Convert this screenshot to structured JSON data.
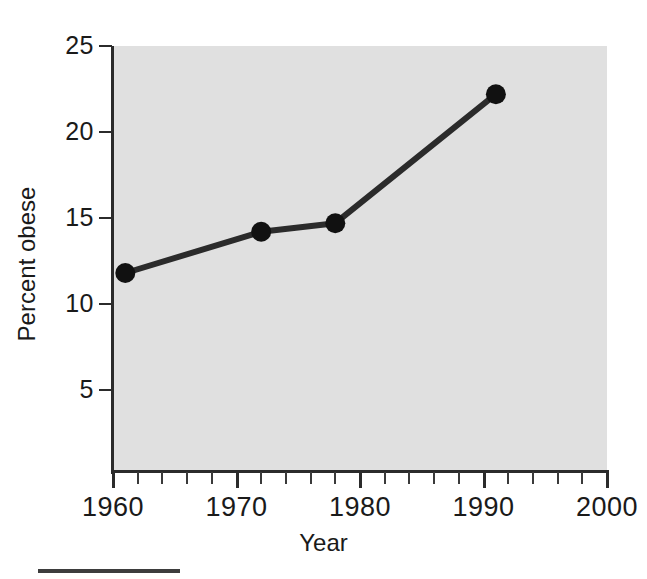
{
  "chart_data": {
    "type": "line",
    "title": "",
    "subtitle": "",
    "xlabel": "Year",
    "ylabel": "Percent obese",
    "xlim": [
      1960,
      2000
    ],
    "ylim": [
      0,
      25
    ],
    "xticks": [
      1960,
      1970,
      1980,
      1990,
      2000
    ],
    "xtick_labels": [
      "1960",
      "1970",
      "1980",
      "1990",
      "2000"
    ],
    "xminor_tick_step": 2,
    "yticks": [
      5,
      10,
      15,
      20,
      25
    ],
    "ytick_labels": [
      "5",
      "10",
      "15",
      "20",
      "25"
    ],
    "grid": false,
    "legend": null,
    "plot_background": "#e0e0e0",
    "line_color": "#2b2b2b",
    "marker_color": "#111111",
    "marker_style": "circle",
    "x": [
      1961,
      1972,
      1978,
      1991
    ],
    "y": [
      11.8,
      14.2,
      14.7,
      22.2
    ],
    "series": [
      {
        "name": "Percent obese",
        "points": [
          {
            "x": 1961,
            "y": 11.8
          },
          {
            "x": 1972,
            "y": 14.2
          },
          {
            "x": 1978,
            "y": 14.7
          },
          {
            "x": 1991,
            "y": 22.2
          }
        ]
      }
    ],
    "annotations": []
  },
  "figure": {
    "bottom_rule_present": true
  }
}
